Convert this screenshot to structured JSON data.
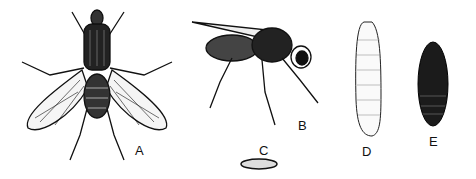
{
  "figure": {
    "panels": [
      {
        "id": "A",
        "label": "A",
        "subject": "adult fly, dorsal view"
      },
      {
        "id": "B",
        "label": "B",
        "subject": "adult fly, side view"
      },
      {
        "id": "C",
        "label": "C",
        "subject": "egg"
      },
      {
        "id": "D",
        "label": "D",
        "subject": "larva (maggot)"
      },
      {
        "id": "E",
        "label": "E",
        "subject": "pupa"
      }
    ]
  }
}
